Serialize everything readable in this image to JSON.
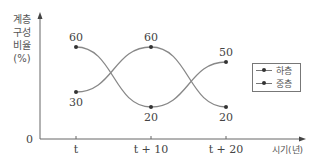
{
  "chart_data": {
    "type": "line",
    "title": "",
    "xlabel": "시기(년)",
    "ylabel": "계층 구성 비율 (%)",
    "ylabel_lines": [
      "계층",
      "구성",
      "비율",
      "(%)"
    ],
    "categories": [
      "t",
      "t+10",
      "t+20"
    ],
    "series": [
      {
        "name": "",
        "values": [
          60,
          20,
          50
        ]
      },
      {
        "name": "",
        "values": [
          30,
          60,
          20
        ]
      }
    ],
    "legend": [
      "하층",
      "중층"
    ],
    "origin_label": "0",
    "ylim": [
      0,
      70
    ],
    "grid": false,
    "legend_position": "right"
  },
  "colors": {
    "line": "#888888",
    "point": "#333333",
    "axis": "#666666",
    "text": "#444444"
  }
}
